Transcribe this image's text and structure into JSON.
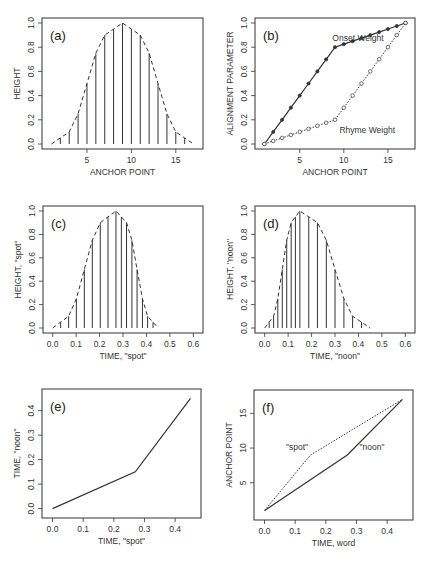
{
  "chart_data": [
    {
      "id": "a",
      "panel_label": "(a)",
      "type": "bar",
      "title": "",
      "xlabel": "ANCHOR POINT",
      "ylabel": "HEIGHT",
      "xlim": [
        0.5,
        17.5
      ],
      "ylim": [
        0,
        1
      ],
      "xticks": [
        5,
        10,
        15
      ],
      "yticks": [
        0.0,
        0.2,
        0.4,
        0.6,
        0.8,
        1.0
      ],
      "ytick_labels": [
        "0.0",
        "0.2",
        "0.4",
        "0.6",
        "0.8",
        "1.0"
      ],
      "x": [
        1,
        2,
        3,
        4,
        5,
        6,
        7,
        8,
        9,
        10,
        11,
        12,
        13,
        14,
        15,
        16,
        17
      ],
      "values": [
        0,
        0.05,
        0.1,
        0.25,
        0.5,
        0.75,
        0.9,
        0.95,
        1.0,
        0.95,
        0.9,
        0.75,
        0.5,
        0.25,
        0.1,
        0.05,
        0
      ],
      "envelope": "dashed",
      "grid": false
    },
    {
      "id": "b",
      "panel_label": "(b)",
      "type": "line",
      "xlabel": "ANCHOR POINT",
      "ylabel": "ALIGNMENT PARAMETER",
      "xlim": [
        0.5,
        17.5
      ],
      "ylim": [
        0,
        1
      ],
      "xticks": [
        5,
        10,
        15
      ],
      "yticks": [
        0.0,
        0.2,
        0.4,
        0.6,
        0.8,
        1.0
      ],
      "ytick_labels": [
        "0.0",
        "0.2",
        "0.4",
        "0.6",
        "0.8",
        "1.0"
      ],
      "x": [
        1,
        2,
        3,
        4,
        5,
        6,
        7,
        8,
        9,
        10,
        11,
        12,
        13,
        14,
        15,
        16,
        17
      ],
      "series": [
        {
          "name": "Onset Weight",
          "style": "solid",
          "marker": "filled-circle",
          "values": [
            0,
            0.1,
            0.2,
            0.3,
            0.4,
            0.5,
            0.6,
            0.7,
            0.8,
            0.825,
            0.85,
            0.875,
            0.9,
            0.925,
            0.95,
            0.975,
            1.0
          ]
        },
        {
          "name": "Rhyme Weight",
          "style": "dotted",
          "marker": "open-circle",
          "values": [
            0,
            0.025,
            0.05,
            0.075,
            0.1,
            0.125,
            0.15,
            0.175,
            0.2,
            0.3,
            0.4,
            0.5,
            0.6,
            0.7,
            0.8,
            0.9,
            1.0
          ]
        }
      ],
      "annotations": [
        {
          "text": "Onset Weight",
          "x": 8.7,
          "y": 0.85
        },
        {
          "text": "Rhyme Weight",
          "x": 9.5,
          "y": 0.09
        }
      ],
      "grid": false
    },
    {
      "id": "c",
      "panel_label": "(c)",
      "type": "bar",
      "xlabel": "TIME, \"spot\"",
      "ylabel": "HEIGHT, \"spot\"",
      "xlim": [
        -0.02,
        0.62
      ],
      "ylim": [
        0,
        1
      ],
      "xticks": [
        0.0,
        0.1,
        0.2,
        0.3,
        0.4,
        0.5,
        0.6
      ],
      "xtick_labels": [
        "0.0",
        "0.1",
        "0.2",
        "0.3",
        "0.4",
        "0.5",
        "0.6"
      ],
      "yticks": [
        0.0,
        0.2,
        0.4,
        0.6,
        0.8,
        1.0
      ],
      "ytick_labels": [
        "0.0",
        "0.2",
        "0.4",
        "0.6",
        "0.8",
        "1.0"
      ],
      "x": [
        0,
        0.034,
        0.068,
        0.101,
        0.135,
        0.169,
        0.203,
        0.236,
        0.27,
        0.293,
        0.315,
        0.338,
        0.36,
        0.383,
        0.405,
        0.428,
        0.45
      ],
      "values": [
        0,
        0.05,
        0.1,
        0.25,
        0.5,
        0.75,
        0.9,
        0.95,
        1.0,
        0.95,
        0.9,
        0.75,
        0.5,
        0.25,
        0.1,
        0.05,
        0
      ],
      "envelope": "dashed",
      "grid": false
    },
    {
      "id": "d",
      "panel_label": "(d)",
      "type": "bar",
      "xlabel": "TIME, \"noon\"",
      "ylabel": "HEIGHT, \"noon\"",
      "xlim": [
        -0.02,
        0.62
      ],
      "ylim": [
        0,
        1
      ],
      "xticks": [
        0.0,
        0.1,
        0.2,
        0.3,
        0.4,
        0.5,
        0.6
      ],
      "xtick_labels": [
        "0.0",
        "0.1",
        "0.2",
        "0.3",
        "0.4",
        "0.5",
        "0.6"
      ],
      "yticks": [
        0.0,
        0.2,
        0.4,
        0.6,
        0.8,
        1.0
      ],
      "ytick_labels": [
        "0.0",
        "0.2",
        "0.4",
        "0.6",
        "0.8",
        "1.0"
      ],
      "x": [
        0,
        0.019,
        0.038,
        0.056,
        0.075,
        0.094,
        0.113,
        0.131,
        0.15,
        0.188,
        0.225,
        0.263,
        0.3,
        0.338,
        0.375,
        0.413,
        0.45
      ],
      "values": [
        0,
        0.05,
        0.1,
        0.25,
        0.5,
        0.75,
        0.9,
        0.95,
        1.0,
        0.95,
        0.9,
        0.75,
        0.5,
        0.25,
        0.1,
        0.05,
        0
      ],
      "envelope": "dashed",
      "grid": false
    },
    {
      "id": "e",
      "panel_label": "(e)",
      "type": "line",
      "xlabel": "TIME, \"spot\"",
      "ylabel": "TIME, \"noon\"",
      "xlim": [
        -0.018,
        0.468
      ],
      "ylim": [
        -0.018,
        0.468
      ],
      "xticks": [
        0.0,
        0.1,
        0.2,
        0.3,
        0.4
      ],
      "xtick_labels": [
        "0.0",
        "0.1",
        "0.2",
        "0.3",
        "0.4"
      ],
      "yticks": [
        0.0,
        0.1,
        0.2,
        0.3,
        0.4
      ],
      "ytick_labels": [
        "0.0",
        "0.1",
        "0.2",
        "0.3",
        "0.4"
      ],
      "series": [
        {
          "name": "warp",
          "style": "solid",
          "x": [
            0,
            0.27,
            0.45
          ],
          "values": [
            0,
            0.15,
            0.45
          ]
        }
      ],
      "grid": false
    },
    {
      "id": "f",
      "panel_label": "(f)",
      "type": "line",
      "xlabel": "TIME, word",
      "ylabel": "ANCHOR POINT",
      "xlim": [
        -0.018,
        0.468
      ],
      "ylim": [
        0.36,
        17.64
      ],
      "xticks": [
        0.0,
        0.1,
        0.2,
        0.3,
        0.4
      ],
      "xtick_labels": [
        "0.0",
        "0.1",
        "0.2",
        "0.3",
        "0.4"
      ],
      "yticks": [
        5,
        10,
        15
      ],
      "ytick_labels": [
        "5",
        "10",
        "15"
      ],
      "series": [
        {
          "name": "\"spot\"",
          "style": "dotted",
          "x": [
            0,
            0.15,
            0.45
          ],
          "values": [
            1,
            9,
            17
          ]
        },
        {
          "name": "\"noon\"",
          "style": "solid",
          "x": [
            0,
            0.27,
            0.45
          ],
          "values": [
            1,
            9,
            17
          ]
        }
      ],
      "annotations": [
        {
          "text": "\"spot\"",
          "x": 0.07,
          "y": 9.7
        },
        {
          "text": "\"noon\"",
          "x": 0.31,
          "y": 9.7
        }
      ],
      "grid": false
    }
  ],
  "layout": {
    "panels": {
      "a": {
        "left": 42,
        "top": 18,
        "right": 203,
        "bottom": 149
      },
      "b": {
        "left": 255,
        "top": 18,
        "right": 415,
        "bottom": 149
      },
      "c": {
        "left": 43,
        "top": 206,
        "right": 203,
        "bottom": 333
      },
      "d": {
        "left": 255,
        "top": 206,
        "right": 415,
        "bottom": 333
      },
      "e": {
        "left": 42,
        "top": 389,
        "right": 201,
        "bottom": 518
      },
      "f": {
        "left": 254,
        "top": 390,
        "right": 413,
        "bottom": 520
      }
    }
  }
}
